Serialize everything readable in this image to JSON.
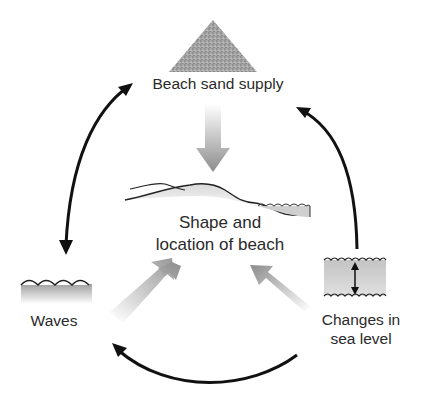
{
  "diagram": {
    "type": "cycle",
    "nodes": {
      "beach_sand_supply": {
        "label": "Beach sand supply",
        "icon": "sand-pile-icon"
      },
      "shape_and_location": {
        "line1": "Shape and",
        "line2": "location of beach",
        "icon": "beach-profile-icon"
      },
      "waves": {
        "label": "Waves",
        "icon": "waves-icon"
      },
      "changes_in_sea_level": {
        "line1": "Changes in",
        "line2": "sea level",
        "icon": "sea-level-change-icon"
      }
    },
    "edges": [
      {
        "from": "Beach sand supply",
        "to": "Waves",
        "style": "black curved double-headed arrow"
      },
      {
        "from": "Changes in sea level",
        "to": "Beach sand supply",
        "style": "black curved arrow"
      },
      {
        "from": "Changes in sea level",
        "to": "Waves",
        "style": "black curved arrow"
      },
      {
        "from": "Beach sand supply",
        "to": "Shape and location of beach",
        "style": "gray gradient arrow"
      },
      {
        "from": "Waves",
        "to": "Shape and location of beach",
        "style": "gray gradient arrow"
      },
      {
        "from": "Changes in sea level",
        "to": "Shape and location of beach",
        "style": "gray gradient arrow"
      }
    ],
    "colors": {
      "arrow_black": "#111111",
      "arrow_gray": "#9a9a9a",
      "fill_gray": "#c8c8c8",
      "text": "#2a2a2a"
    }
  }
}
